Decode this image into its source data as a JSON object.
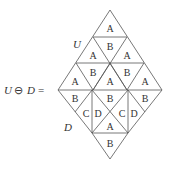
{
  "equation": {
    "lhs_var1": "U",
    "operator": "⊖",
    "lhs_var2": "D",
    "equals": "="
  },
  "labels": {
    "upper": "U",
    "lower": "D"
  },
  "upper_tiles": {
    "row1": [
      "A"
    ],
    "row2": [
      "A",
      "B",
      "A"
    ],
    "row3": [
      "A",
      "B",
      "A",
      "B",
      "A"
    ]
  },
  "lower_tiles": {
    "row1": [
      "B",
      "B",
      "B"
    ],
    "row2": [
      "C",
      "D",
      "C",
      "D"
    ],
    "row3": [
      "A"
    ],
    "row4": [
      "B"
    ]
  },
  "colors": {
    "stroke": "#555555",
    "text": "#333333",
    "background": "#ffffff"
  }
}
